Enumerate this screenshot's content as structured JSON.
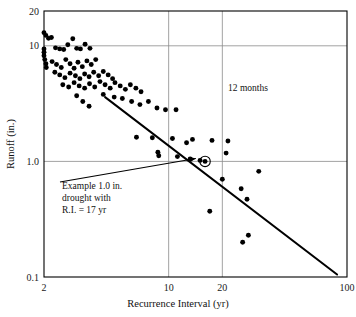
{
  "chart_data": {
    "type": "scatter",
    "title": "",
    "xlabel": "Recurrence Interval (yr)",
    "ylabel": "Runoff (in.)",
    "xscale": "log",
    "yscale": "log",
    "xlim": [
      2,
      100
    ],
    "ylim": [
      0.1,
      20
    ],
    "xticks": [
      2,
      10,
      20,
      100
    ],
    "xticklabels": [
      "2",
      "10",
      "20",
      "100"
    ],
    "yticks": [
      0.1,
      1.0,
      10,
      20
    ],
    "yticklabels": [
      "0.1",
      "1.0",
      "10",
      "20"
    ],
    "grid": "major gridlines at x=10, x=20, y=1.0, y=10",
    "legend": "none",
    "annotations": [
      {
        "name": "duration-note",
        "text": "12 months",
        "x": 40,
        "y": 5.2
      },
      {
        "name": "example-callout",
        "lines": [
          "Example 1.0 in.",
          "drought with",
          "R.I. = 17 yr"
        ],
        "x": 5.4,
        "y": 0.66
      },
      {
        "name": "highlight-marker",
        "text": "circled point",
        "x": 16,
        "y": 1.0
      }
    ],
    "series": [
      {
        "name": "12-month drought runoff",
        "marker": "filled-circle",
        "color": "#000000",
        "points": [
          [
            2.0,
            13.0
          ],
          [
            2.05,
            12.3
          ],
          [
            2.12,
            11.6
          ],
          [
            2.0,
            9.4
          ],
          [
            2.0,
            8.8
          ],
          [
            2.0,
            8.2
          ],
          [
            2.02,
            7.6
          ],
          [
            2.05,
            7.0
          ],
          [
            2.06,
            6.5
          ],
          [
            2.2,
            11.8
          ],
          [
            2.32,
            9.6
          ],
          [
            2.45,
            9.4
          ],
          [
            2.58,
            9.3
          ],
          [
            2.72,
            10.2
          ],
          [
            2.9,
            11.5
          ],
          [
            3.05,
            9.5
          ],
          [
            3.2,
            9.4
          ],
          [
            3.4,
            10.3
          ],
          [
            3.62,
            9.5
          ],
          [
            2.22,
            7.3
          ],
          [
            2.35,
            6.9
          ],
          [
            2.5,
            6.5
          ],
          [
            2.65,
            7.6
          ],
          [
            2.8,
            7.0
          ],
          [
            2.95,
            6.4
          ],
          [
            3.1,
            7.2
          ],
          [
            3.28,
            6.6
          ],
          [
            3.48,
            7.4
          ],
          [
            3.68,
            6.9
          ],
          [
            3.9,
            7.6
          ],
          [
            2.3,
            5.9
          ],
          [
            2.45,
            5.6
          ],
          [
            2.62,
            5.3
          ],
          [
            2.8,
            5.8
          ],
          [
            3.0,
            5.5
          ],
          [
            3.18,
            5.2
          ],
          [
            3.38,
            5.7
          ],
          [
            3.58,
            5.4
          ],
          [
            3.8,
            5.9
          ],
          [
            4.05,
            5.5
          ],
          [
            4.3,
            6.0
          ],
          [
            4.58,
            5.6
          ],
          [
            4.85,
            5.2
          ],
          [
            2.55,
            4.6
          ],
          [
            2.75,
            4.4
          ],
          [
            2.95,
            4.8
          ],
          [
            3.15,
            4.5
          ],
          [
            3.38,
            4.3
          ],
          [
            3.6,
            4.7
          ],
          [
            3.85,
            4.4
          ],
          [
            4.12,
            4.9
          ],
          [
            4.4,
            4.6
          ],
          [
            4.7,
            4.3
          ],
          [
            5.0,
            4.8
          ],
          [
            5.35,
            4.5
          ],
          [
            5.72,
            4.2
          ],
          [
            6.1,
            4.6
          ],
          [
            6.55,
            4.3
          ],
          [
            7.0,
            4.0
          ],
          [
            3.05,
            3.7
          ],
          [
            3.3,
            3.3
          ],
          [
            3.58,
            3.0
          ],
          [
            4.3,
            3.8
          ],
          [
            4.95,
            3.6
          ],
          [
            5.5,
            3.5
          ],
          [
            6.2,
            3.3
          ],
          [
            6.9,
            3.1
          ],
          [
            7.7,
            3.3
          ],
          [
            8.6,
            2.9
          ],
          [
            9.6,
            2.8
          ],
          [
            11.0,
            2.8
          ],
          [
            6.6,
            1.62
          ],
          [
            8.1,
            1.6
          ],
          [
            8.7,
            1.2
          ],
          [
            8.8,
            1.12
          ],
          [
            10.5,
            1.58
          ],
          [
            11.2,
            1.1
          ],
          [
            12.6,
            1.45
          ],
          [
            13.6,
            1.55
          ],
          [
            13.2,
            1.05
          ],
          [
            15.0,
            1.02
          ],
          [
            16.0,
            1.0
          ],
          [
            17.5,
            1.52
          ],
          [
            20.0,
            0.7
          ],
          [
            21.0,
            1.18
          ],
          [
            21.5,
            1.5
          ],
          [
            17.0,
            0.37
          ],
          [
            25.5,
            0.58
          ],
          [
            27.5,
            0.47
          ],
          [
            32.0,
            0.82
          ],
          [
            26.0,
            0.2
          ],
          [
            28.0,
            0.23
          ]
        ]
      }
    ],
    "trendline": {
      "name": "fitted-frequency-line",
      "x0": 4.4,
      "y0": 3.6,
      "x1": 88.0,
      "y1": 0.105,
      "color": "#000000"
    }
  },
  "axes": {
    "x_title": "Recurrence Interval (yr)",
    "y_title": "Runoff (in.)",
    "x_tick_labels": [
      "2",
      "10",
      "20",
      "100"
    ],
    "y_tick_labels": [
      "20",
      "10",
      "1.0",
      "0.1"
    ]
  },
  "labels": {
    "duration_note": "12 months",
    "callout_line1": "Example 1.0 in.",
    "callout_line2": "drought with",
    "callout_line3": "R.I. = 17 yr"
  },
  "colors": {
    "marker": "#000000",
    "line": "#000000",
    "grid": "#8a8a8a",
    "axis": "#000000",
    "background": "#ffffff"
  }
}
